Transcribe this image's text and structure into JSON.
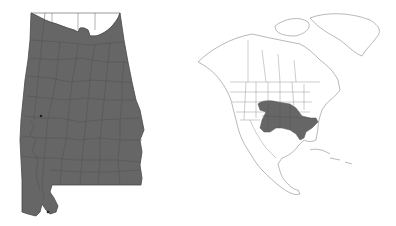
{
  "figure": {
    "panels": [
      {
        "id": "alabama-county-map",
        "region": "Alabama",
        "type": "county distribution map",
        "fill_color": "#666666",
        "unfilled_color": "#ffffff",
        "border_color": "#4a4a4a",
        "note": "Nearly all counties shaded; northern tier (Tennessee Valley counties) unshaded"
      },
      {
        "id": "north-america-range-map",
        "region": "North America",
        "type": "range map",
        "fill_color": "#666666",
        "outline_color": "#888888",
        "note": "Range shaded across southeastern United States"
      }
    ]
  }
}
